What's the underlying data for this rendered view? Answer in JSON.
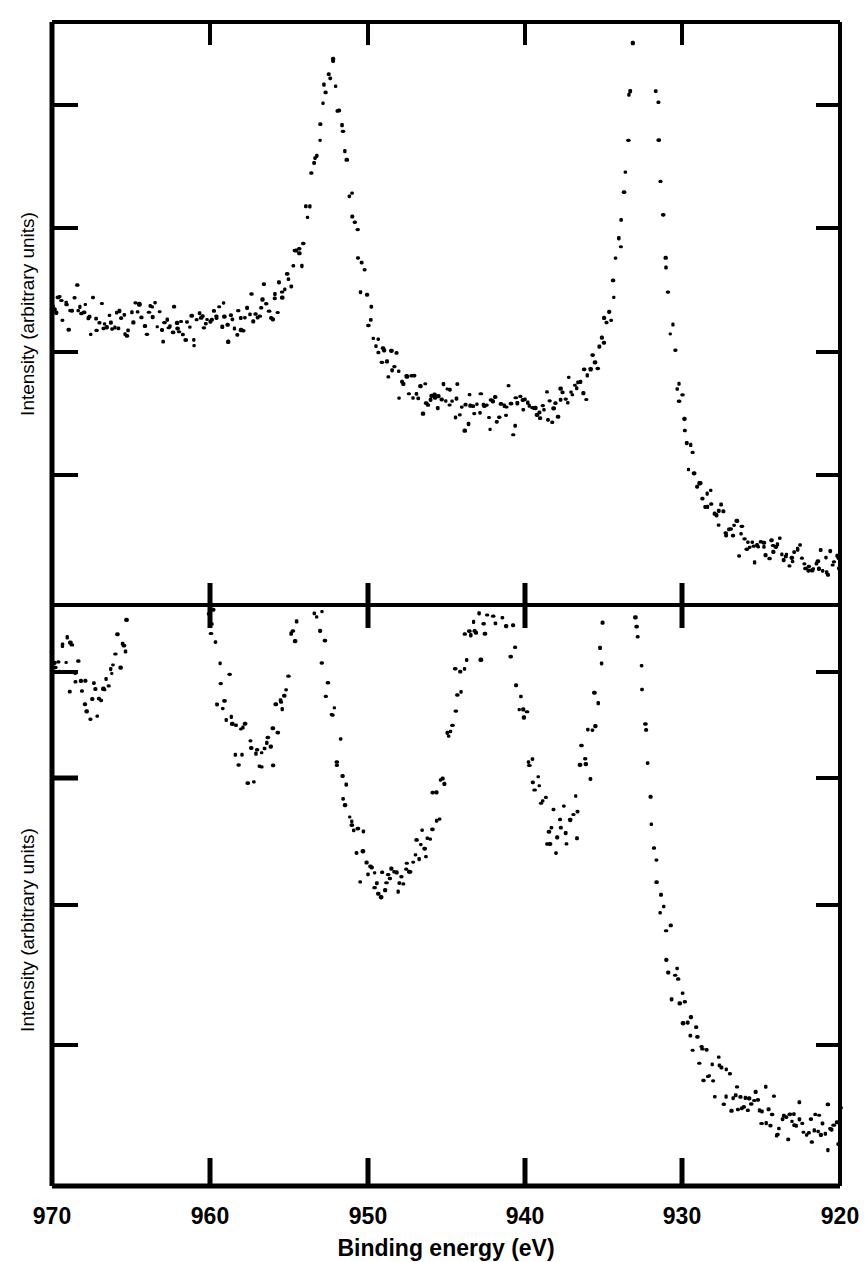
{
  "figure": {
    "type": "xps-spectra-figure",
    "background_color": "#ffffff",
    "ink_color": "#000000"
  },
  "axis": {
    "x_title": "Binding energy (eV)",
    "x_tick_labels": [
      "970",
      "960",
      "950",
      "940",
      "930",
      "920"
    ],
    "y_title_top": "Intensity (arbitrary units)",
    "y_title_bottom": "Intensity (arbitrary units)"
  },
  "chart_data": [
    {
      "type": "scatter",
      "panel": "top",
      "title": "",
      "xlabel": "Binding energy (eV)",
      "ylabel": "Intensity (arbitrary units)",
      "xlim": [
        970,
        920
      ],
      "ylim": [
        0,
        1
      ],
      "x_ticks": [
        970,
        960,
        950,
        940,
        930,
        920
      ],
      "y_ticks": [
        0.13,
        0.35,
        0.58,
        0.8
      ],
      "y_tick_labels": [],
      "grid": false,
      "legend": null,
      "annotations": [],
      "description": "Cu 2p core-level photoemission spectrum of metallic Cu with two sharp spin-orbit split peaks and no shake-up satellites",
      "peaks": [
        {
          "name": "Cu 2p3/2",
          "binding_energy": 932.4,
          "relative_height": 1.05,
          "width": 1.3
        },
        {
          "name": "Cu 2p1/2",
          "binding_energy": 952.2,
          "relative_height": 0.55,
          "width": 1.5
        }
      ],
      "baseline_left": 0.33,
      "baseline_right": 0.045,
      "noise_amplitude": 0.022,
      "point_count": 420,
      "x": [
        970.0,
        969.88,
        969.76,
        969.64,
        969.52,
        969.4,
        969.28,
        969.16,
        969.04,
        968.92,
        968.8,
        968.69,
        968.57,
        968.45,
        968.33,
        968.21,
        968.09,
        967.97,
        967.85,
        967.73,
        967.61,
        967.49,
        967.37,
        967.25,
        967.13,
        967.01,
        966.89,
        966.77,
        966.65,
        966.53,
        966.41,
        966.29,
        966.17,
        966.06,
        965.94,
        965.82,
        965.7,
        965.58,
        965.46,
        965.34,
        965.22,
        965.1,
        964.98,
        964.86,
        964.74,
        964.62,
        964.5,
        964.38,
        964.26,
        964.14,
        964.02,
        963.9,
        963.78,
        963.66,
        963.54,
        963.43,
        963.31,
        963.19,
        963.07,
        962.95,
        962.83,
        962.71,
        962.59,
        962.47,
        962.35,
        962.23,
        962.11,
        961.99,
        961.87,
        961.75,
        961.63,
        961.51,
        961.39,
        961.27,
        961.15,
        961.03,
        960.91,
        960.8,
        960.68,
        960.56,
        960.44,
        960.32,
        960.2,
        960.08,
        959.96,
        959.84,
        959.72,
        959.6,
        959.48,
        959.36,
        959.24,
        959.12,
        959.0,
        958.88,
        958.76,
        958.64,
        958.52,
        958.4,
        958.28,
        958.17,
        958.05,
        957.93,
        957.81,
        957.69,
        957.57,
        957.45,
        957.33,
        957.21,
        957.09,
        956.97,
        956.85,
        956.73,
        956.61,
        956.49,
        956.37,
        956.25,
        956.13,
        956.01,
        955.89,
        955.77,
        955.65,
        955.54,
        955.42,
        955.3,
        955.18,
        955.06,
        954.94,
        954.82,
        954.7,
        954.58,
        954.46,
        954.34,
        954.22,
        954.1,
        953.98,
        953.86,
        953.74,
        953.62,
        953.5,
        953.38,
        953.26,
        953.14,
        953.02,
        952.91,
        952.79,
        952.67,
        952.55,
        952.43,
        952.31,
        952.19,
        952.07,
        951.95,
        951.83,
        951.71,
        951.59,
        951.47,
        951.35,
        951.23,
        951.11,
        950.99,
        950.87,
        950.75,
        950.63,
        950.51,
        950.39,
        950.28,
        950.16,
        950.04,
        949.92,
        949.8,
        949.68,
        949.56,
        949.44,
        949.32,
        949.2,
        949.08,
        948.96,
        948.84,
        948.72,
        948.6,
        948.48,
        948.36,
        948.24,
        948.12,
        948.0,
        947.88,
        947.76,
        947.65,
        947.53,
        947.41,
        947.29,
        947.17,
        947.05,
        946.93,
        946.81,
        946.69,
        946.57,
        946.45,
        946.33,
        946.21,
        946.09,
        945.97,
        945.85,
        945.73,
        945.61,
        945.49,
        945.37,
        945.25,
        945.13,
        945.02,
        944.9,
        944.78,
        944.66,
        944.54,
        944.42,
        944.3,
        944.18,
        944.06,
        943.94,
        943.82,
        943.7,
        943.58,
        943.46,
        943.34,
        943.22,
        943.1,
        942.98,
        942.86,
        942.74,
        942.62,
        942.5,
        942.39,
        942.27,
        942.15,
        942.03,
        941.91,
        941.79,
        941.67,
        941.55,
        941.43,
        941.31,
        941.19,
        941.07,
        940.95,
        940.83,
        940.71,
        940.59,
        940.47,
        940.35,
        940.23,
        940.11,
        939.99,
        939.87,
        939.76,
        939.64,
        939.52,
        939.4,
        939.28,
        939.16,
        939.04,
        938.92,
        938.8,
        938.68,
        938.56,
        938.44,
        938.32,
        938.2,
        938.08,
        937.96,
        937.84,
        937.72,
        937.6,
        937.48,
        937.36,
        937.24,
        937.13,
        937.01,
        936.89,
        936.77,
        936.65,
        936.53,
        936.41,
        936.29,
        936.17,
        936.05,
        935.93,
        935.81,
        935.69,
        935.57,
        935.45,
        935.33,
        935.21,
        935.09,
        934.97,
        934.85,
        934.73,
        934.61,
        934.5,
        934.38,
        934.26,
        934.14,
        934.02,
        933.9,
        933.78,
        933.66,
        933.54,
        933.42,
        933.3,
        933.18,
        933.06,
        932.94,
        932.82,
        932.7,
        932.58,
        932.46,
        932.34,
        932.22,
        932.1,
        931.98,
        931.87,
        931.75,
        931.63,
        931.51,
        931.39,
        931.27,
        931.15,
        931.03,
        930.91,
        930.79,
        930.67,
        930.55,
        930.43,
        930.31,
        930.19,
        930.07,
        929.95,
        929.83,
        929.71,
        929.59,
        929.47,
        929.35,
        929.24,
        929.12,
        929.0,
        928.88,
        928.76,
        928.64,
        928.52,
        928.4,
        928.28,
        928.16,
        928.04,
        927.92,
        927.8,
        927.68,
        927.56,
        927.44,
        927.32,
        927.2,
        927.08,
        926.96,
        926.84,
        926.72,
        926.61,
        926.49,
        926.37,
        926.25,
        926.13,
        926.01,
        925.89,
        925.77,
        925.65,
        925.53,
        925.41,
        925.29,
        925.17,
        925.05,
        924.93,
        924.81,
        924.69,
        924.57,
        924.45,
        924.33,
        924.21,
        924.1,
        923.98,
        923.86,
        923.74,
        923.62,
        923.5,
        923.38,
        923.26,
        923.14,
        923.02,
        922.9,
        922.78,
        922.66,
        922.54,
        922.42,
        922.3,
        922.18,
        922.06,
        921.94,
        921.82,
        921.7,
        921.58,
        921.47,
        921.35,
        921.23,
        921.11,
        920.99,
        920.87,
        920.75,
        920.63,
        920.51,
        920.39,
        920.27,
        920.15,
        920.03
      ]
    },
    {
      "type": "scatter",
      "panel": "bottom",
      "title": "",
      "xlabel": "Binding energy (eV)",
      "ylabel": "Intensity (arbitrary units)",
      "xlim": [
        970,
        920
      ],
      "ylim": [
        0,
        1
      ],
      "x_ticks": [
        970,
        960,
        950,
        940,
        930,
        920
      ],
      "y_ticks": [
        0.82,
        0.71,
        0.58,
        0.42
      ],
      "y_tick_labels": [],
      "grid": false,
      "legend": null,
      "annotations": [],
      "description": "Cu 2p core-level photoemission spectrum of CuO showing main 2p3/2 and 2p1/2 lines plus strong broad shake-up satellite structure at higher binding energy",
      "peaks": [
        {
          "name": "Cu 2p3/2 main",
          "binding_energy": 933.8,
          "relative_height": 1.0,
          "width": 1.9
        },
        {
          "name": "Cu 2p3/2 satellite A",
          "binding_energy": 941.2,
          "relative_height": 0.42,
          "width": 1.7
        },
        {
          "name": "Cu 2p3/2 satellite B",
          "binding_energy": 943.5,
          "relative_height": 0.44,
          "width": 2.1
        },
        {
          "name": "Cu 2p1/2 main",
          "binding_energy": 953.6,
          "relative_height": 0.58,
          "width": 2.0
        },
        {
          "name": "Cu 2p1/2 satellite A",
          "binding_energy": 961.0,
          "relative_height": 0.3,
          "width": 2.0
        },
        {
          "name": "Cu 2p1/2 satellite B",
          "binding_energy": 963.2,
          "relative_height": 0.62,
          "width": 2.3
        },
        {
          "name": "high-BE edge",
          "binding_energy": 969.6,
          "relative_height": 0.33,
          "width": 2.6
        }
      ],
      "baseline_left": 0.3,
      "baseline_right": 0.055,
      "noise_amplitude": 0.03,
      "point_count": 420
    }
  ]
}
